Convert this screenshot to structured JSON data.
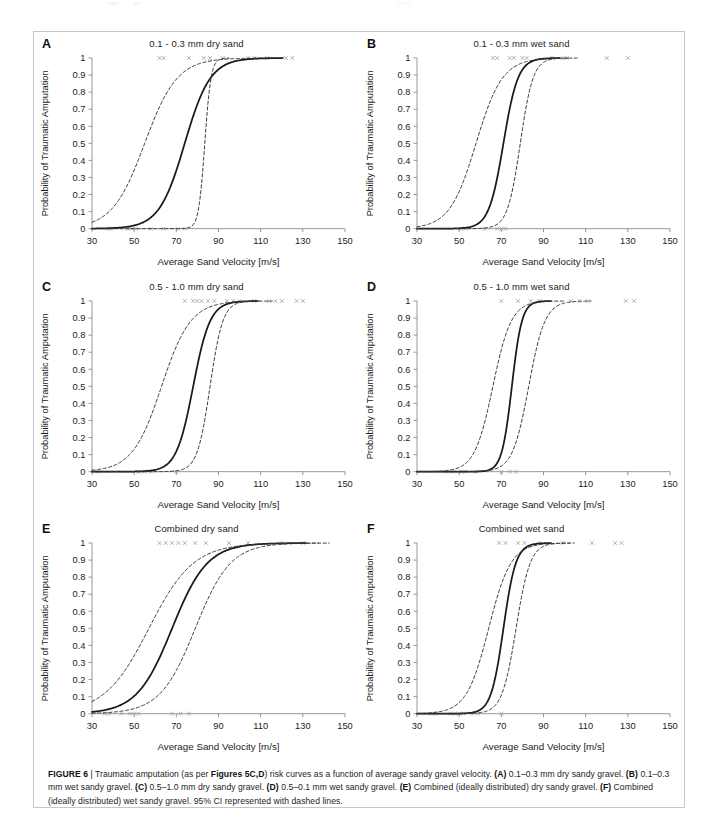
{
  "figure": {
    "id": "FIGURE 6",
    "separator": "|",
    "caption_line1_pre": "Traumatic amputation (as per ",
    "caption_ref": "Figures 5C,D",
    "caption_line1_post": ") risk curves as a function of average sandy gravel velocity. ",
    "caption_items": [
      {
        "label": "(A)",
        "text": " 0.1–0.3 mm dry sandy gravel."
      },
      {
        "label": "(B)",
        "text": " 0.1–0.3 mm wet sandy gravel."
      },
      {
        "label": "(C)",
        "text": " 0.5–1.0 mm dry sandy gravel."
      },
      {
        "label": "(D)",
        "text": " 0.5–0.1 mm wet sandy gravel."
      },
      {
        "label": "(E)",
        "text": " Combined (ideally distributed) dry sandy gravel."
      },
      {
        "label": "(F)",
        "text": " Combined (ideally distributed) wet sandy gravel."
      }
    ],
    "caption_tail": " 95% CI represented with dashed lines.",
    "colors": {
      "curve": "#1a1a1a",
      "ci": "#3a3a3a",
      "axis": "#8c8c8c",
      "marker": "#9a9a9a",
      "text": "#1c1c1c",
      "border": "#c3c6cb"
    }
  },
  "axes_common": {
    "xlabel": "Average Sand Velocity [m/s]",
    "ylabel": "Probability of Traumatic Amputation",
    "xlim": [
      30,
      150
    ],
    "ylim": [
      0,
      1
    ],
    "xticks": [
      30,
      50,
      70,
      90,
      110,
      130,
      150
    ],
    "xticklabels": [
      "30",
      "50",
      "70",
      "90",
      "110",
      "130",
      "150"
    ],
    "yticks": [
      0,
      0.1,
      0.2,
      0.3,
      0.4,
      0.5,
      0.6,
      0.7,
      0.8,
      0.9,
      1
    ],
    "yticklabels": [
      "0",
      "0.1",
      "0.2",
      "0.3",
      "0.4",
      "0.5",
      "0.6",
      "0.7",
      "0.8",
      "0.9",
      "1"
    ],
    "grid": false,
    "legend": "none"
  },
  "chart_data": [
    {
      "panel": "A",
      "letter": "A",
      "type": "line",
      "title": "0.1 - 0.3 mm dry sand",
      "xlabel": "Average Sand Velocity [m/s]",
      "ylabel": "Probability of Traumatic Amputation",
      "xlim": [
        30,
        150
      ],
      "ylim": [
        0,
        1
      ],
      "series": [
        {
          "name": "Risk curve (fit)",
          "style": "solid",
          "x50": 74.0,
          "slope": 0.165
        },
        {
          "name": "95% CI lower",
          "style": "dashed",
          "x50": 55.0,
          "slope": 0.13
        },
        {
          "name": "95% CI upper",
          "style": "dashed",
          "x50": 83.5,
          "slope": 0.68
        }
      ],
      "markers_y1": [
        62,
        64,
        76,
        83,
        86,
        92,
        104,
        107,
        113,
        122,
        125
      ],
      "markers_y0": [
        38,
        39,
        47,
        49,
        51,
        58,
        64,
        71,
        74
      ]
    },
    {
      "panel": "B",
      "letter": "B",
      "type": "line",
      "title": "0.1 - 0.3 mm wet sand",
      "xlabel": "Average Sand Velocity [m/s]",
      "ylabel": "Probability of Traumatic Amputation",
      "xlim": [
        30,
        150
      ],
      "ylim": [
        0,
        1
      ],
      "series": [
        {
          "name": "Risk curve (fit)",
          "style": "solid",
          "x50": 71.0,
          "slope": 0.29
        },
        {
          "name": "95% CI lower",
          "style": "dashed",
          "x50": 58.0,
          "slope": 0.16
        },
        {
          "name": "95% CI upper",
          "style": "dashed",
          "x50": 79.0,
          "slope": 0.33
        }
      ],
      "markers_y1": [
        66,
        68,
        74,
        76,
        80,
        82,
        94,
        99,
        101,
        120,
        130
      ],
      "markers_y0": [
        51,
        53,
        62,
        68,
        70,
        72
      ]
    },
    {
      "panel": "C",
      "letter": "C",
      "type": "line",
      "title": "0.5 - 1.0 mm dry sand",
      "xlabel": "Average Sand Velocity [m/s]",
      "ylabel": "Probability of Traumatic Amputation",
      "xlim": [
        30,
        150
      ],
      "ylim": [
        0,
        1
      ],
      "series": [
        {
          "name": "Risk curve (fit)",
          "style": "solid",
          "x50": 78.0,
          "slope": 0.25
        },
        {
          "name": "95% CI lower",
          "style": "dashed",
          "x50": 63.0,
          "slope": 0.145
        },
        {
          "name": "95% CI upper",
          "style": "dashed",
          "x50": 86.0,
          "slope": 0.33
        }
      ],
      "markers_y1": [
        74,
        78,
        80,
        82,
        85,
        88,
        94,
        97,
        100,
        107,
        114,
        117,
        120,
        127,
        130
      ],
      "markers_y0": [
        33,
        52,
        55,
        58,
        70
      ]
    },
    {
      "panel": "D",
      "letter": "D",
      "type": "line",
      "title": "0.5 - 1.0 mm wet sand",
      "xlabel": "Average Sand Velocity [m/s]",
      "ylabel": "Probability of Traumatic Amputation",
      "xlim": [
        30,
        150
      ],
      "ylim": [
        0,
        1
      ],
      "series": [
        {
          "name": "Risk curve (fit)",
          "style": "solid",
          "x50": 75.0,
          "slope": 0.42
        },
        {
          "name": "95% CI lower",
          "style": "dashed",
          "x50": 66.0,
          "slope": 0.23
        },
        {
          "name": "95% CI upper",
          "style": "dashed",
          "x50": 83.0,
          "slope": 0.26
        }
      ],
      "markers_y1": [
        70,
        78,
        84,
        88,
        103,
        107,
        111,
        129,
        133
      ],
      "markers_y0": [
        44,
        47,
        51,
        53,
        58,
        70,
        74,
        77
      ]
    },
    {
      "panel": "E",
      "letter": "E",
      "type": "line",
      "title": "Combined dry sand",
      "xlabel": "Average Sand Velocity [m/s]",
      "ylabel": "Probability of Traumatic Amputation",
      "xlim": [
        30,
        150
      ],
      "ylim": [
        0,
        1
      ],
      "series": [
        {
          "name": "Risk curve (fit)",
          "style": "solid",
          "x50": 68.0,
          "slope": 0.12
        },
        {
          "name": "95% CI lower",
          "style": "dashed",
          "x50": 57.0,
          "slope": 0.095
        },
        {
          "name": "95% CI upper",
          "style": "dashed",
          "x50": 79.0,
          "slope": 0.12
        }
      ],
      "markers_y1": [
        62,
        65,
        68,
        71,
        74,
        79,
        84,
        95,
        104,
        120,
        130
      ],
      "markers_y0": [
        36,
        38,
        44,
        48,
        50,
        52,
        68,
        72,
        76
      ]
    },
    {
      "panel": "F",
      "letter": "F",
      "type": "line",
      "title": "Combined wet sand",
      "xlabel": "Average Sand Velocity [m/s]",
      "ylabel": "Probability of Traumatic Amputation",
      "xlim": [
        30,
        150
      ],
      "ylim": [
        0,
        1
      ],
      "series": [
        {
          "name": "Risk curve (fit)",
          "style": "solid",
          "x50": 71.0,
          "slope": 0.34
        },
        {
          "name": "95% CI lower",
          "style": "dashed",
          "x50": 64.0,
          "slope": 0.19
        },
        {
          "name": "95% CI upper",
          "style": "dashed",
          "x50": 77.0,
          "slope": 0.3
        }
      ],
      "markers_y1": [
        69,
        72,
        78,
        81,
        88,
        99,
        113,
        124,
        127
      ],
      "markers_y0": [
        37,
        39,
        46,
        48,
        50,
        52,
        56,
        59,
        70
      ]
    }
  ]
}
